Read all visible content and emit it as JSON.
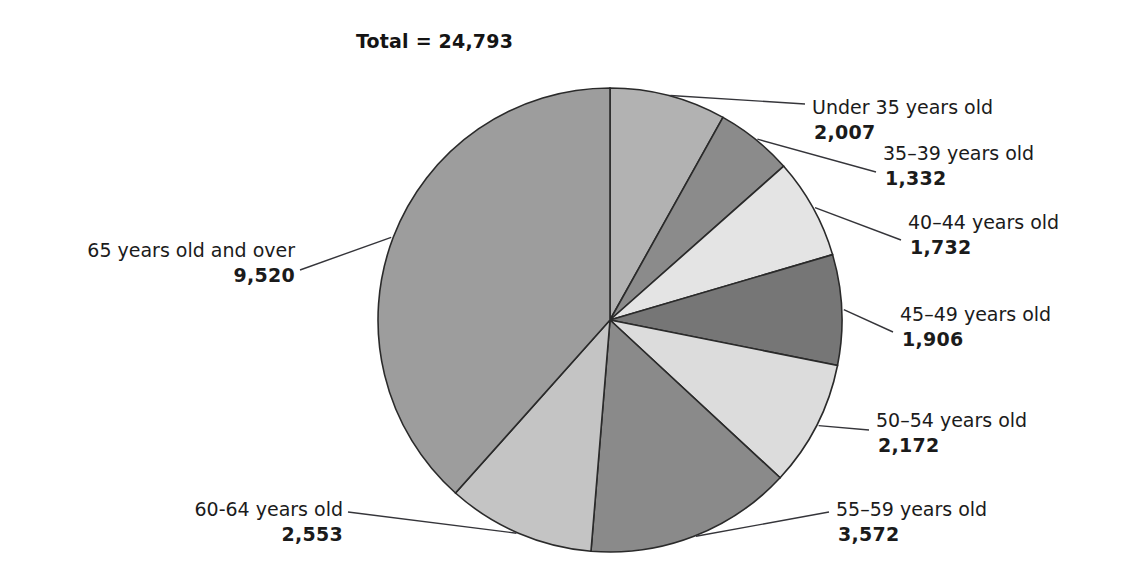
{
  "chart_data": {
    "type": "pie",
    "title": "Total = 24,793",
    "total": 24793,
    "total_label": "Total = 24,793",
    "start_angle_deg": 0,
    "direction": "clockwise",
    "legend": "callout-labels",
    "grid": false,
    "xlabel": "",
    "ylabel": "",
    "categories": [
      "Under 35 years old",
      "35–39 years old",
      "40–44 years old",
      "45–49 years old",
      "50–54 years old",
      "55–59 years old",
      "60-64 years old",
      "65 years old and over"
    ],
    "values": [
      2007,
      1332,
      1732,
      1906,
      2172,
      3572,
      2553,
      9520
    ],
    "value_labels": [
      "2,007",
      "1,332",
      "1,732",
      "1,906",
      "2,172",
      "3,572",
      "2,553",
      "9,520"
    ],
    "slice_colors": [
      "#b0b0b0",
      "#8f8f8f",
      "#e2e2e2",
      "#6f6f6f",
      "#d8d8d8",
      "#8a8a8a",
      "#6b6b6b",
      "#c8c8c8",
      "#9a9a9a"
    ],
    "slices": [
      {
        "label": "Under 35 years old",
        "value": 2007,
        "value_label": "2,007",
        "color": "#b2b2b2",
        "side": "right"
      },
      {
        "label": "35–39 years old",
        "value": 1332,
        "value_label": "1,332",
        "color": "#8b8b8b",
        "side": "right"
      },
      {
        "label": "40–44 years old",
        "value": 1732,
        "value_label": "1,732",
        "color": "#e4e4e4",
        "side": "right"
      },
      {
        "label": "45–49 years old",
        "value": 1906,
        "value_label": "1,906",
        "color": "#767676",
        "side": "right"
      },
      {
        "label": "50–54 years old",
        "value": 2172,
        "value_label": "2,172",
        "color": "#dcdcdc",
        "side": "right"
      },
      {
        "label": "55–59 years old",
        "value": 3572,
        "value_label": "3,572",
        "color": "#8a8a8a",
        "side": "right"
      },
      {
        "label": "60-64 years old",
        "value": 2553,
        "value_label": "2,553",
        "color": "#c4c4c4",
        "side": "left"
      },
      {
        "label": "65 years old and over",
        "value": 9520,
        "value_label": "9,520",
        "color": "#9d9d9d",
        "side": "left"
      }
    ],
    "stroke_color": "#2a2a2a",
    "background": "#ffffff"
  },
  "geometry": {
    "center_x": 610,
    "center_y": 320,
    "radius": 232
  }
}
